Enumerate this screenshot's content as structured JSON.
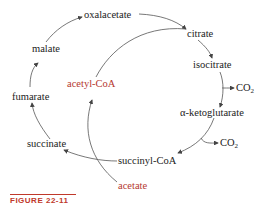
{
  "nodes": {
    "oxalacetate": "oxalacetate",
    "citrate": "citrate",
    "isocitrate": "isocitrate",
    "alpha_ketoglutarate": "α-ketoglutarate",
    "succinyl_coa": "succinyl-CoA",
    "succinate": "succinate",
    "fumarate": "fumarate",
    "malate": "malate",
    "acetyl_coa": "acetyl-CoA",
    "acetate": "acetate"
  },
  "products": {
    "co2_1": "CO",
    "co2_2": "CO",
    "co2_sub": "2"
  },
  "colors": {
    "text": "#222222",
    "highlight": "#b5372f",
    "arrow": "#444444"
  },
  "caption": "FIGURE 22-11"
}
